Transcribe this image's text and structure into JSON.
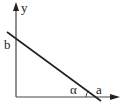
{
  "diagram": {
    "axes": {
      "y_label": "y",
      "origin": [
        16,
        97
      ],
      "y_axis_top": [
        16,
        3
      ],
      "x_axis_right": [
        119,
        97
      ]
    },
    "line": {
      "start": [
        7,
        32
      ],
      "end": [
        101,
        101
      ],
      "y_intercept_label": "b",
      "x_intercept_label": "a",
      "angle_label": "α"
    },
    "colors": {
      "stroke": "#333333",
      "line": "#222222",
      "background": "#ffffff"
    }
  }
}
